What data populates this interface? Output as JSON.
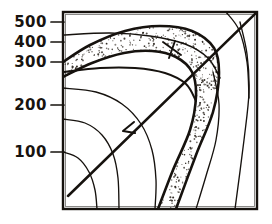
{
  "figure": {
    "title": "",
    "background_color": "#ffffff",
    "ink_color": "#16120e",
    "stipple_color": "#2a241d",
    "style": "hand-drawn scanned line art"
  },
  "plot_frame": {
    "left": 63,
    "top": 12,
    "right": 257,
    "bottom": 209,
    "border_color": "#16120e"
  },
  "axis": {
    "orientation": "vertical-left",
    "tick_labels": [
      "500",
      "400",
      "300",
      "200",
      "100"
    ],
    "tick_values": [
      500,
      400,
      300,
      200,
      100
    ],
    "tick_y": [
      22,
      42,
      62,
      105,
      152
    ],
    "tick_mark_length": 12,
    "xlabel": "",
    "ylabel": ""
  },
  "annotations": {
    "arrow_marker": {
      "name": "arrow-head",
      "x": 123,
      "y": 131,
      "direction": "down-left"
    },
    "cross_marker": {
      "name": "cross-tick",
      "x": 172,
      "y": 48
    }
  },
  "chart_data": {
    "type": "line",
    "title": "",
    "xlabel": "",
    "ylabel": "",
    "ylim": [
      0,
      560
    ],
    "xlim": [
      0,
      100
    ],
    "grid": false,
    "legend": "none",
    "tick_labels": [
      "500",
      "400",
      "300",
      "200",
      "100"
    ],
    "tick_values": [
      500,
      400,
      300,
      200,
      100
    ],
    "shaded_band": {
      "name": "stippled-band",
      "fill": "stipple",
      "description": "Shaded band arcing over the top-left then descending steeply to the bottom-right"
    },
    "series": [
      {
        "name": "band-upper-boundary",
        "kind": "curve",
        "points": [
          [
            63,
            62
          ],
          [
            90,
            45
          ],
          [
            125,
            31
          ],
          [
            160,
            26
          ],
          [
            192,
            31
          ],
          [
            214,
            48
          ],
          [
            219,
            74
          ],
          [
            213,
            112
          ],
          [
            196,
            155
          ],
          [
            176,
            209
          ]
        ]
      },
      {
        "name": "band-lower-boundary",
        "kind": "curve",
        "points": [
          [
            63,
            77
          ],
          [
            92,
            63
          ],
          [
            124,
            53
          ],
          [
            152,
            51
          ],
          [
            176,
            57
          ],
          [
            192,
            72
          ],
          [
            196,
            96
          ],
          [
            190,
            130
          ],
          [
            173,
            170
          ],
          [
            158,
            209
          ]
        ]
      },
      {
        "name": "contour-outer",
        "kind": "curve",
        "points": [
          [
            63,
            35
          ],
          [
            110,
            33
          ],
          [
            150,
            36
          ],
          [
            185,
            44
          ],
          [
            208,
            58
          ],
          [
            220,
            78
          ]
        ]
      },
      {
        "name": "contour-300",
        "kind": "curve",
        "points": [
          [
            63,
            72
          ],
          [
            100,
            68
          ],
          [
            135,
            68
          ],
          [
            165,
            73
          ],
          [
            186,
            84
          ],
          [
            196,
            101
          ]
        ]
      },
      {
        "name": "contour-mid-1",
        "kind": "curve",
        "points": [
          [
            63,
            88
          ],
          [
            96,
            92
          ],
          [
            122,
            104
          ],
          [
            141,
            124
          ],
          [
            152,
            150
          ],
          [
            156,
            180
          ],
          [
            155,
            209
          ]
        ]
      },
      {
        "name": "contour-mid-2",
        "kind": "curve",
        "points": [
          [
            63,
            119
          ],
          [
            85,
            123
          ],
          [
            102,
            135
          ],
          [
            113,
            154
          ],
          [
            118,
            178
          ],
          [
            119,
            209
          ]
        ]
      },
      {
        "name": "contour-mid-3",
        "kind": "curve",
        "points": [
          [
            63,
            152
          ],
          [
            78,
            158
          ],
          [
            89,
            172
          ],
          [
            95,
            190
          ],
          [
            97,
            209
          ]
        ]
      },
      {
        "name": "contour-right-1",
        "kind": "curve",
        "points": [
          [
            213,
            72
          ],
          [
            219,
            104
          ],
          [
            216,
            140
          ],
          [
            206,
            176
          ],
          [
            196,
            209
          ]
        ]
      },
      {
        "name": "contour-right-2",
        "kind": "curve",
        "points": [
          [
            240,
            22
          ],
          [
            247,
            54
          ],
          [
            249,
            92
          ],
          [
            244,
            140
          ],
          [
            235,
            209
          ]
        ]
      },
      {
        "name": "diagonal-arrow-line",
        "kind": "line",
        "points": [
          [
            68,
            196
          ],
          [
            257,
            12
          ]
        ]
      },
      {
        "name": "corner-crossing-curve",
        "kind": "curve",
        "points": [
          [
            226,
            12
          ],
          [
            239,
            30
          ],
          [
            247,
            62
          ],
          [
            249,
            98
          ]
        ]
      }
    ]
  }
}
